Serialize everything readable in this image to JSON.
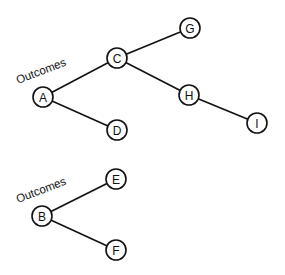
{
  "diagram": {
    "type": "tree",
    "node_radius": 10,
    "colors": {
      "stroke": "#111111",
      "fill": "#ffffff",
      "background": "#ffffff"
    },
    "trees": [
      {
        "root_label": "Outcomes",
        "label_pos": {
          "x": 18,
          "y": 84
        },
        "nodes": [
          {
            "id": "A",
            "label": "A",
            "x": 43,
            "y": 97
          },
          {
            "id": "C",
            "label": "C",
            "x": 117,
            "y": 58
          },
          {
            "id": "D",
            "label": "D",
            "x": 117,
            "y": 130
          },
          {
            "id": "G",
            "label": "G",
            "x": 190,
            "y": 28
          },
          {
            "id": "H",
            "label": "H",
            "x": 189,
            "y": 95
          },
          {
            "id": "I",
            "label": "I",
            "x": 257,
            "y": 123
          }
        ],
        "edges": [
          [
            "A",
            "C"
          ],
          [
            "A",
            "D"
          ],
          [
            "C",
            "G"
          ],
          [
            "C",
            "H"
          ],
          [
            "H",
            "I"
          ]
        ]
      },
      {
        "root_label": "Outcomes",
        "label_pos": {
          "x": 18,
          "y": 203
        },
        "nodes": [
          {
            "id": "B",
            "label": "B",
            "x": 42,
            "y": 216
          },
          {
            "id": "E",
            "label": "E",
            "x": 116,
            "y": 179
          },
          {
            "id": "F",
            "label": "F",
            "x": 116,
            "y": 250
          }
        ],
        "edges": [
          [
            "B",
            "E"
          ],
          [
            "B",
            "F"
          ]
        ]
      }
    ]
  }
}
